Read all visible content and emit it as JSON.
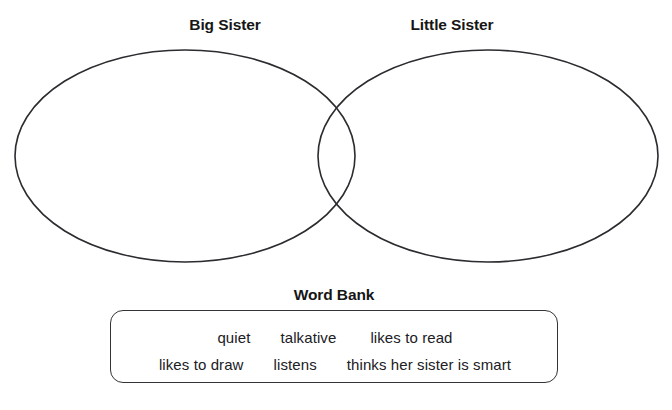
{
  "page": {
    "clipped_top_text": "",
    "background_color": "#ffffff",
    "ink_color": "#1a1a1a"
  },
  "venn": {
    "left_label": "Big Sister",
    "right_label": "Little Sister",
    "stroke_color": "#2b2b30",
    "left_ellipse": {
      "cx": 185,
      "cy": 156,
      "rx": 170,
      "ry": 106
    },
    "right_ellipse": {
      "cx": 488,
      "cy": 156,
      "rx": 170,
      "ry": 106
    }
  },
  "word_bank": {
    "title": "Word Bank",
    "border_color": "#333338",
    "rows": [
      {
        "words": [
          "quiet",
          "talkative",
          "likes to read"
        ]
      },
      {
        "words": [
          "likes to draw",
          "listens",
          "thinks her sister is smart"
        ]
      }
    ]
  }
}
